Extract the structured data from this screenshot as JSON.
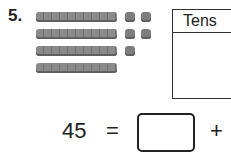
{
  "problem": {
    "number": "5.",
    "model": {
      "tens_rods": 4,
      "ones_cubes": 5,
      "cube_rows": [
        2,
        2,
        1
      ]
    },
    "table": {
      "headers": [
        "Tens"
      ]
    },
    "equation": {
      "left": "45",
      "equals": "=",
      "blank": "",
      "plus": "+"
    }
  }
}
